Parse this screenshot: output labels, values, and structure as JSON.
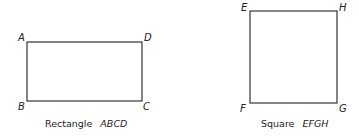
{
  "figures": [
    {
      "kind": "rectangle",
      "caption_prefix": "Rectangle",
      "caption_name": "ABCD",
      "vertices": {
        "top_left": "A",
        "bottom_left": "B",
        "bottom_right": "C",
        "top_right": "D"
      }
    },
    {
      "kind": "square",
      "caption_prefix": "Square",
      "caption_name": "EFGH",
      "vertices": {
        "top_left": "E",
        "bottom_left": "F",
        "bottom_right": "G",
        "top_right": "H"
      }
    }
  ],
  "colors": {
    "stroke": "#333333",
    "text": "#222222",
    "background": "#ffffff"
  }
}
